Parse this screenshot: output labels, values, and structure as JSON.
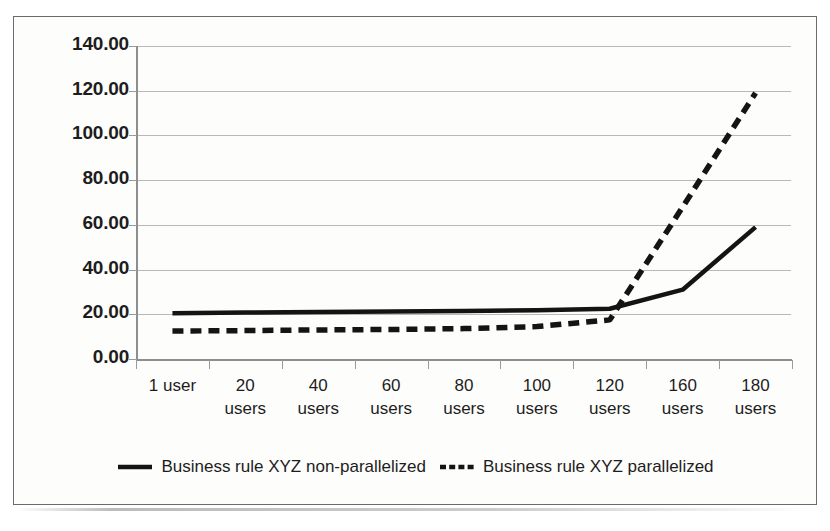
{
  "chart_data": {
    "type": "line",
    "title": "",
    "subtitle": "",
    "xlabel": "",
    "ylabel": "",
    "categories": [
      "1 user",
      "20 users",
      "40 users",
      "60 users",
      "80 users",
      "100 users",
      "120 users",
      "160 users",
      "180 users"
    ],
    "category_lines": [
      [
        "1 user"
      ],
      [
        "20",
        "users"
      ],
      [
        "40",
        "users"
      ],
      [
        "60",
        "users"
      ],
      [
        "80",
        "users"
      ],
      [
        "100",
        "users"
      ],
      [
        "120",
        "users"
      ],
      [
        "160",
        "users"
      ],
      [
        "180",
        "users"
      ]
    ],
    "series": [
      {
        "name": "Business rule XYZ non-parallelized",
        "style": "solid",
        "color": "#141414",
        "values": [
          20.5,
          20.8,
          21.0,
          21.2,
          21.5,
          21.8,
          22.5,
          31.0,
          59.0
        ]
      },
      {
        "name": "Business rule XYZ parallelized",
        "style": "dashed",
        "color": "#141414",
        "values": [
          12.5,
          12.7,
          13.0,
          13.2,
          13.6,
          14.5,
          17.5,
          68.0,
          119.0
        ]
      }
    ],
    "ylim": [
      0,
      140
    ],
    "ytick_values": [
      140,
      120,
      100,
      80,
      60,
      40,
      20,
      0
    ],
    "ytick_labels": [
      "140.00",
      "120.00",
      "100.00",
      "80.00",
      "60.00",
      "40.00",
      "20.00",
      "0.00"
    ],
    "grid": true,
    "grid_color": "#b9b9b9",
    "legend_position": "bottom",
    "legend": [
      {
        "label": "Business rule XYZ non-parallelized",
        "style": "solid"
      },
      {
        "label": "Business rule XYZ parallelized",
        "style": "dashed"
      }
    ],
    "background_color": "#fdfdfc",
    "frame_color": "#6b6b6b"
  }
}
